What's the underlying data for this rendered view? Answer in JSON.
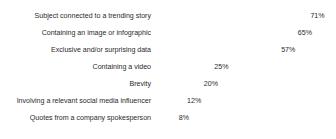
{
  "chart_data": {
    "type": "bar",
    "orientation": "horizontal",
    "title": "",
    "xlabel": "",
    "ylabel": "",
    "xlim": [
      0,
      100
    ],
    "grid": false,
    "legend": false,
    "value_suffix": "%",
    "bar_color": "#8c8c8c",
    "text_color": "#2b2b2b",
    "background_color": "#ffffff",
    "categories": [
      "Subject connected to a trending story",
      "Containing an image or infographic",
      "Exclusive and/or surprising data",
      "Containing a video",
      "Brevity",
      "Involving a relevant social media influencer",
      "Quotes from a company spokesperson"
    ],
    "values": [
      71,
      65,
      57,
      25,
      20,
      12,
      8
    ],
    "value_labels": [
      "71%",
      "65%",
      "57%",
      "25%",
      "20%",
      "12%",
      "8%"
    ]
  }
}
